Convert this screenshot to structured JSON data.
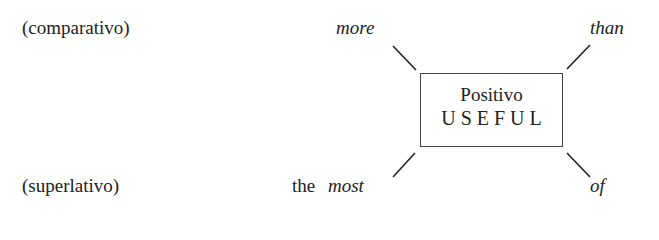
{
  "labels": {
    "comparative": "(comparativo)",
    "superlative": "(superlativo)"
  },
  "words": {
    "more": "more",
    "than": "than",
    "the": "the",
    "most": "most",
    "of": "of"
  },
  "box": {
    "title": "Positivo",
    "word": "USEFUL"
  }
}
